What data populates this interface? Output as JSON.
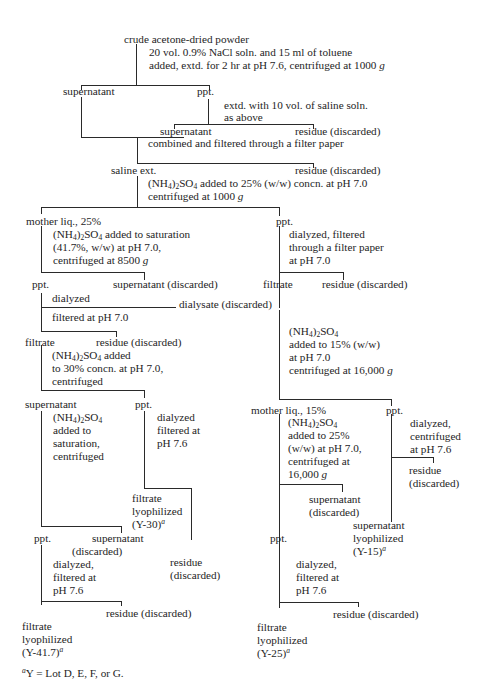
{
  "diagram": {
    "start": "crude acetone-dried powder",
    "step1": [
      "20 vol. 0.9% NaCl soln. and 15 ml of toluene",
      "added, extd. for 2 hr at pH 7.6, centrifuged at 1000 g"
    ],
    "s1_supernatant": "supernatant",
    "s1_ppt": "ppt.",
    "step2": [
      "extd. with 10 vol. of saline soln.",
      "as above"
    ],
    "s2_supernatant": "supernatant",
    "s2_residue": "residue (discarded)",
    "combine": "combined and filtered through a filter paper",
    "saline_ext": "saline ext.",
    "s3_residue": "residue (discarded)",
    "step3": [
      "(NH4)2SO4 added to 25% (w/w) concn. at pH 7.0",
      "centrifuged at 1000 g"
    ],
    "left": {
      "mother_liq": "mother liq., 25%",
      "step": [
        "(NH4)2SO4 added to saturation",
        "(41.7%, w/w) at pH 7.0,",
        "centrifuged at 8500 g"
      ],
      "ppt": "ppt.",
      "supernatant_discarded": "supernatant (discarded)",
      "dialyzed": "dialyzed",
      "dialysate_discarded": "dialysate (discarded)",
      "filtered": "filtered at pH 7.0",
      "filtrate": "filtrate",
      "residue_discarded": "residue (discarded)",
      "step2": [
        "(NH4)2SO4 added",
        "to 30% concn. at pH 7.0,",
        "centrifuged"
      ],
      "supernatant": "supernatant",
      "ppt2": "ppt.",
      "step3": [
        "(NH4)2SO4",
        "added to",
        "saturation,",
        "centrifuged"
      ],
      "ppt_step": [
        "dialyzed",
        "filtered at",
        "pH 7.6"
      ],
      "y30": [
        "filtrate",
        "lyophilized",
        "(Y-30)"
      ],
      "y30_residue": [
        "residue",
        "(discarded)"
      ],
      "ppt3": "ppt.",
      "supernatant_discarded2": [
        "supernatant",
        "(discarded)"
      ],
      "step4": [
        "dialyzed,",
        "filtered at",
        "pH 7.6"
      ],
      "residue_discarded2": "residue (discarded)",
      "y417": [
        "filtrate",
        "lyophilized",
        "(Y-41.7)"
      ]
    },
    "right": {
      "ppt": "ppt.",
      "step": [
        "dialyzed, filtered",
        "through a filter paper",
        "at pH 7.0"
      ],
      "filtrate": "filtrate",
      "residue_discarded": "residue (discarded)",
      "step2": [
        "(NH4)2SO4",
        "added to 15% (w/w)",
        "at pH 7.0",
        "centrifuged at 16,000 g"
      ],
      "mother_liq": "mother liq., 15%",
      "ppt2": "ppt.",
      "step3": [
        "(NH4)2SO4",
        "added to 25%",
        "(w/w) at pH 7.0,",
        "centrifuged at",
        "16,000 g"
      ],
      "ppt_step": [
        "dialyzed,",
        "centrifuged",
        "at pH 7.6"
      ],
      "ppt_residue": [
        "residue",
        "(discarded)"
      ],
      "supernatant_discarded": [
        "supernatant",
        "(discarded)"
      ],
      "y15": [
        "supernatant",
        "lyophilized",
        "(Y-15)"
      ],
      "ppt3": "ppt.",
      "step4": [
        "dialyzed,",
        "filtered at",
        "pH 7.6"
      ],
      "residue_discarded2": "residue (discarded)",
      "y25": [
        "filtrate",
        "lyophilized",
        "(Y-25)"
      ]
    },
    "footnote_mark": "a",
    "footnote": "Y = Lot D, E, F, or G."
  }
}
